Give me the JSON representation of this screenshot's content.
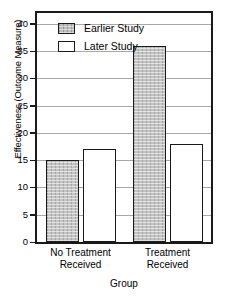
{
  "chart_data": {
    "type": "bar",
    "title": "",
    "xlabel": "Group",
    "ylabel": "Effectiveness (Outcome Measure)",
    "categories": [
      "No Treatment Received",
      "Treatment Received"
    ],
    "category_lines": [
      [
        "No Treatment",
        "Received"
      ],
      [
        "Treatment",
        "Received"
      ]
    ],
    "series": [
      {
        "name": "Earlier Study",
        "values": [
          15,
          36
        ],
        "fill": "#c3c3c3",
        "pattern": "shaded"
      },
      {
        "name": "Later Study",
        "values": [
          17,
          18
        ],
        "fill": "#ffffff",
        "pattern": "solid"
      }
    ],
    "ylim": [
      0,
      42
    ],
    "yticks": [
      0,
      5,
      10,
      15,
      20,
      25,
      30,
      35,
      40
    ],
    "ytick_labels": [
      "0",
      "5",
      "10",
      "15",
      "20",
      "25",
      "30",
      "35",
      "40"
    ],
    "grid": "horizontal",
    "gridline_color": "#a8a8a8",
    "legend_position": "top-left-inside",
    "frame_color": "#1a1a1a",
    "background": "#ffffff"
  },
  "legend": {
    "entries": [
      {
        "label": "Earlier Study",
        "swatch": "earlier"
      },
      {
        "label": "Later Study",
        "swatch": "later"
      }
    ]
  }
}
